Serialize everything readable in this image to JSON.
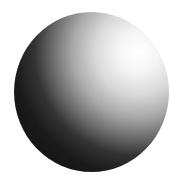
{
  "scene": {
    "subject": "shaded sphere",
    "background_color": "#ffffff",
    "highlight_position": "upper-right",
    "colors": {
      "highlight": "#ffffff",
      "midtone": "#a8a8a8",
      "shadow": "#101010"
    }
  }
}
